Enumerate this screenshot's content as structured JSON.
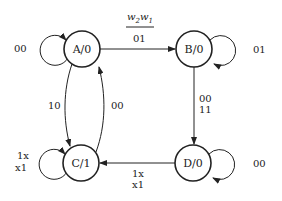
{
  "diagram": {
    "type": "state-machine",
    "input_label": {
      "w2": "w",
      "w2_sub": "2",
      "w1": "w",
      "w1_sub": "1"
    },
    "states": [
      {
        "id": "A",
        "label": "A/0",
        "x": 82,
        "y": 49
      },
      {
        "id": "B",
        "label": "B/0",
        "x": 194,
        "y": 49
      },
      {
        "id": "C",
        "label": "C/1",
        "x": 81,
        "y": 163
      },
      {
        "id": "D",
        "label": "D/0",
        "x": 193,
        "y": 163
      }
    ],
    "transitions": [
      {
        "from": "A",
        "to": "A",
        "label": "00"
      },
      {
        "from": "A",
        "to": "B",
        "label": "01"
      },
      {
        "from": "B",
        "to": "B",
        "label": "01"
      },
      {
        "from": "B",
        "to": "D",
        "label_1": "00",
        "label_2": "11"
      },
      {
        "from": "D",
        "to": "D",
        "label": "00"
      },
      {
        "from": "D",
        "to": "C",
        "label_1": "1x",
        "label_2": "x1"
      },
      {
        "from": "C",
        "to": "C",
        "label_1": "1x",
        "label_2": "x1"
      },
      {
        "from": "A",
        "to": "C",
        "label": "10"
      },
      {
        "from": "C",
        "to": "A",
        "label": "00"
      }
    ]
  }
}
